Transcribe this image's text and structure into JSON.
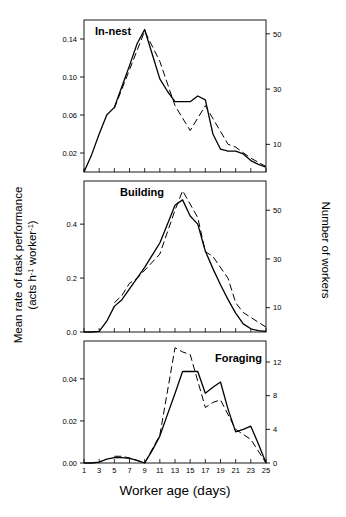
{
  "figure": {
    "xlabel": "Worker age (days)",
    "ylabel_left_line1": "Mean rate of task performance",
    "ylabel_left_line2_a": "(acts h",
    "ylabel_left_line2_sup1": "-1",
    "ylabel_left_line2_b": " worker",
    "ylabel_left_sup2": "-1",
    "ylabel_left_line2_c": ")",
    "ylabel_right": "Number of workers",
    "x_ticks": [
      "1",
      "3",
      "5",
      "7",
      "9",
      "11",
      "13",
      "15",
      "17",
      "19",
      "21",
      "23",
      "25"
    ]
  },
  "chart_data": [
    {
      "type": "line",
      "title": "In-nest",
      "panel": 1,
      "xlabel": "Worker age (days)",
      "ylabel": "Mean rate of task performance (acts h-1 worker-1)",
      "ylabel_right": "Number of workers",
      "xlim": [
        1,
        25
      ],
      "ylim": [
        0.0,
        0.16
      ],
      "ylim_right": [
        0,
        55
      ],
      "yticks": [
        "0.02",
        "0.06",
        "0.10",
        "0.14"
      ],
      "ytick_values": [
        0.02,
        0.06,
        0.1,
        0.14
      ],
      "yticks_right": [
        "10",
        "30",
        "50"
      ],
      "ytick_values_right": [
        10,
        30,
        50
      ],
      "grid": false,
      "legend": "none",
      "x": [
        1,
        2,
        3,
        4,
        5,
        6,
        7,
        8,
        9,
        10,
        11,
        12,
        13,
        14,
        15,
        16,
        17,
        18,
        19,
        20,
        21,
        22,
        23,
        24,
        25
      ],
      "series": [
        {
          "name": "Mean rate of task performance",
          "style": "solid",
          "axis": "left",
          "values": [
            0.0,
            0.018,
            0.04,
            0.06,
            0.068,
            0.09,
            0.112,
            0.135,
            0.15,
            0.124,
            0.098,
            0.085,
            0.074,
            0.074,
            0.074,
            0.08,
            0.076,
            0.04,
            0.024,
            0.022,
            0.022,
            0.019,
            0.012,
            0.008,
            0.005
          ]
        },
        {
          "name": "Number of workers",
          "style": "dashed",
          "axis": "right",
          "values": [
            null,
            null,
            null,
            null,
            23,
            null,
            null,
            null,
            51,
            null,
            40,
            null,
            24,
            null,
            15,
            null,
            24,
            null,
            null,
            10,
            9,
            null,
            5,
            null,
            2
          ]
        }
      ]
    },
    {
      "type": "line",
      "title": "Building",
      "panel": 2,
      "xlabel": "Worker age (days)",
      "ylabel": "Mean rate of task performance (acts h-1 worker-1)",
      "ylabel_right": "Number of workers",
      "xlim": [
        1,
        25
      ],
      "ylim": [
        0.0,
        0.56
      ],
      "ylim_right": [
        0,
        62
      ],
      "yticks": [
        "0.0",
        "0.2",
        "0.4"
      ],
      "ytick_values": [
        0.0,
        0.2,
        0.4
      ],
      "yticks_right": [
        "10",
        "30",
        "50"
      ],
      "ytick_values_right": [
        10,
        30,
        50
      ],
      "grid": false,
      "legend": "none",
      "x": [
        1,
        2,
        3,
        4,
        5,
        6,
        7,
        8,
        9,
        10,
        11,
        12,
        13,
        14,
        15,
        16,
        17,
        18,
        19,
        20,
        21,
        22,
        23,
        24,
        25
      ],
      "series": [
        {
          "name": "Mean rate of task performance",
          "style": "solid",
          "axis": "left",
          "values": [
            0.0,
            0.0,
            0.002,
            0.04,
            0.095,
            0.12,
            0.16,
            0.2,
            0.24,
            0.285,
            0.33,
            0.4,
            0.47,
            0.49,
            0.43,
            0.4,
            0.3,
            0.235,
            0.175,
            0.12,
            0.07,
            0.03,
            0.012,
            0.005,
            0.002
          ]
        },
        {
          "name": "Number of workers",
          "style": "dashed",
          "axis": "right",
          "values": [
            null,
            null,
            null,
            null,
            12,
            15,
            20,
            22,
            null,
            null,
            32,
            null,
            50,
            58,
            null,
            47,
            33,
            31,
            null,
            22,
            12,
            8,
            6,
            null,
            2
          ]
        }
      ]
    },
    {
      "type": "line",
      "title": "Foraging",
      "panel": 3,
      "xlabel": "Worker age (days)",
      "ylabel": "Mean rate of task performance (acts h-1 worker-1)",
      "ylabel_right": "Number of workers",
      "xlim": [
        1,
        25
      ],
      "ylim": [
        0.0,
        0.058
      ],
      "ylim_right": [
        0,
        14.5
      ],
      "yticks": [
        "0.00",
        "0.02",
        "0.04"
      ],
      "ytick_values": [
        0.0,
        0.02,
        0.04
      ],
      "yticks_right": [
        "0",
        "4",
        "8",
        "12"
      ],
      "ytick_values_right": [
        0,
        4,
        8,
        12
      ],
      "grid": false,
      "legend": "none",
      "x": [
        1,
        2,
        3,
        4,
        5,
        6,
        7,
        8,
        9,
        10,
        11,
        12,
        13,
        14,
        15,
        16,
        17,
        18,
        19,
        20,
        21,
        22,
        23,
        24,
        25
      ],
      "series": [
        {
          "name": "Mean rate of task performance",
          "style": "solid",
          "axis": "left",
          "values": [
            0.0,
            0.0,
            0.0004,
            0.0018,
            0.0026,
            0.0026,
            0.0022,
            0.0013,
            0.0,
            0.006,
            0.0128,
            0.023,
            0.033,
            0.0435,
            0.0435,
            0.0435,
            0.0332,
            0.036,
            0.0385,
            0.0255,
            0.0148,
            0.016,
            0.0175,
            0.009,
            0.0
          ]
        },
        {
          "name": "Number of workers",
          "style": "dashed",
          "axis": "right",
          "values": [
            null,
            null,
            null,
            null,
            0.8,
            0.8,
            0.6,
            null,
            0.0,
            null,
            3.3,
            null,
            13.7,
            13.2,
            12.9,
            null,
            6.6,
            7.2,
            7.5,
            null,
            4.0,
            null,
            2.8,
            null,
            0.0
          ]
        }
      ]
    }
  ]
}
